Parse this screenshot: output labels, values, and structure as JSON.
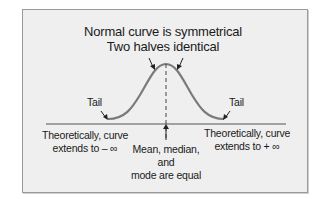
{
  "diagram": {
    "title_line1": "Normal curve is symmetrical",
    "title_line2": "Two halves identical",
    "left_tail_label": "Tail",
    "right_tail_label": "Tail",
    "left_note_line1": "Theoretically, curve",
    "left_note_line2": "extends to – ∞",
    "right_note_line1": "Theoretically, curve",
    "right_note_line2": "extends to + ∞",
    "center_note_line1": "Mean, median,",
    "center_note_line2": "and",
    "center_note_line3": "mode are equal",
    "colors": {
      "background": "#efefef",
      "curve": "#7a7a7a",
      "axis": "#555555",
      "text": "#1a1a1a"
    }
  }
}
